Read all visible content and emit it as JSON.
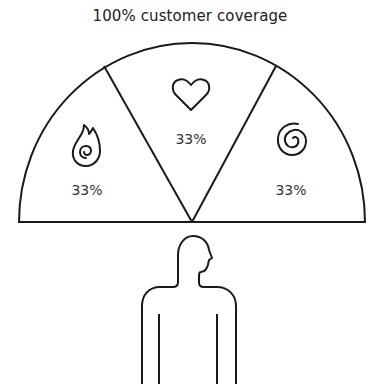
{
  "title": "100% customer coverage",
  "segments": [
    {
      "icon": "flame-spiral-icon",
      "label": "33%"
    },
    {
      "icon": "heart-icon",
      "label": "33%"
    },
    {
      "icon": "spiral-icon",
      "label": "33%"
    }
  ],
  "colors": {
    "stroke": "#1a1a1a",
    "text": "#333333",
    "background": "#ffffff"
  }
}
